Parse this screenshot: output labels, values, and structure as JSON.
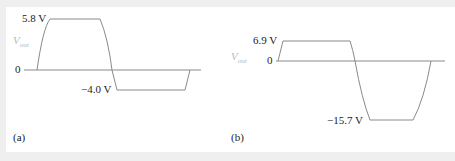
{
  "figure": {
    "panels": [
      {
        "id": "a",
        "caption": "(a)",
        "axis_label_main": "V",
        "axis_label_sub": "out",
        "zero_label": "0",
        "max_label": "5.8 V",
        "min_label": "−4.0 V",
        "max_value": 5.8,
        "min_value": -4.0
      },
      {
        "id": "b",
        "caption": "(b)",
        "axis_label_main": "V",
        "axis_label_sub": "out",
        "zero_label": "0",
        "max_label": "6.9 V",
        "min_label": "−15.7 V",
        "max_value": 6.9,
        "min_value": -15.7
      }
    ],
    "colors": {
      "background": "#efefef",
      "panel": "#ffffff",
      "waveform": "#8a8a8a",
      "axis": "#8a8a8a",
      "text": "#222222",
      "vout_label": "#b8b8b8"
    }
  }
}
